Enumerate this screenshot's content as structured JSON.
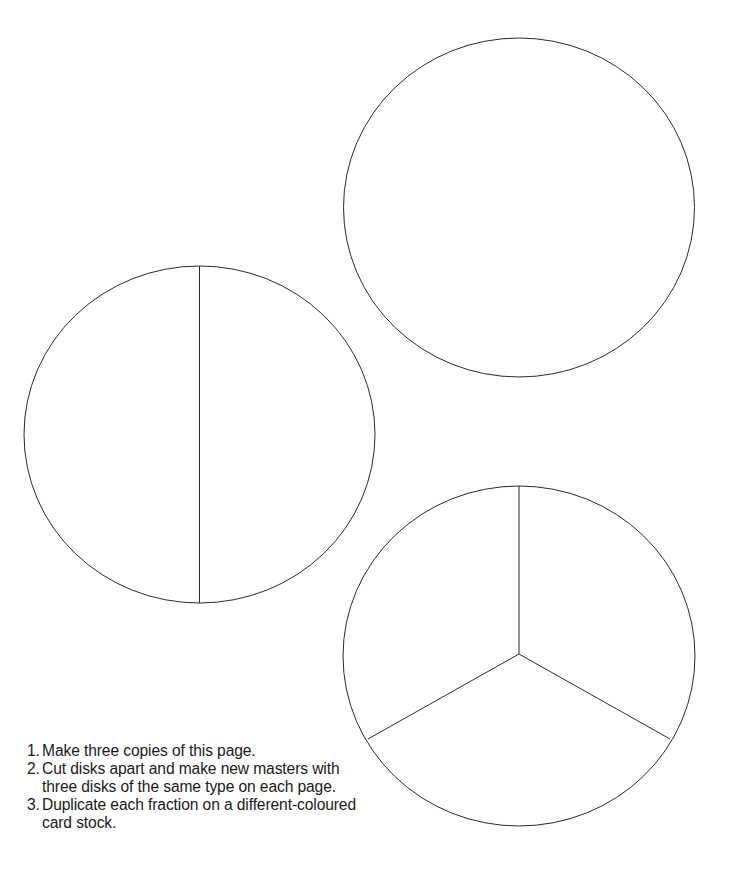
{
  "page": {
    "background": "#ffffff",
    "stroke_color": "#2a2a2a"
  },
  "disks": [
    {
      "name": "whole",
      "fraction": "1",
      "parts": 1,
      "center": [
        519,
        207
      ],
      "radius": [
        176,
        170
      ]
    },
    {
      "name": "halves",
      "fraction": "1/2",
      "parts": 2,
      "center": [
        200,
        434
      ],
      "radius": [
        176,
        168
      ]
    },
    {
      "name": "thirds",
      "fraction": "1/3",
      "parts": 3,
      "center": [
        519,
        655
      ],
      "radius": [
        176,
        170
      ]
    }
  ],
  "instructions": [
    {
      "num": "1.",
      "text": "Make three copies of this page."
    },
    {
      "num": "2.",
      "text": "Cut disks apart and make new masters with three disks of the same type on each page."
    },
    {
      "num": "3.",
      "text": "Duplicate each fraction on a different-coloured card stock."
    }
  ]
}
